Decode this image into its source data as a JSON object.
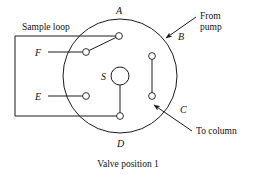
{
  "figure": {
    "caption": "Valve position 1",
    "kind": "rotary-sample-injection-valve-diagram"
  },
  "labels": {
    "sample_loop": "Sample loop",
    "from_pump_line1": "From",
    "from_pump_line2": "pump",
    "to_column": "To column"
  },
  "ports": [
    {
      "id": "A",
      "label": "A",
      "position": "top"
    },
    {
      "id": "B",
      "label": "B",
      "position": "upper-right"
    },
    {
      "id": "C",
      "label": "C",
      "position": "lower-right"
    },
    {
      "id": "D",
      "label": "D",
      "position": "bottom"
    },
    {
      "id": "E",
      "label": "E",
      "position": "lower-left"
    },
    {
      "id": "F",
      "label": "F",
      "position": "upper-left"
    }
  ],
  "rotor": {
    "id": "S",
    "label": "S"
  },
  "connections": [
    {
      "from": "A",
      "to": "F",
      "style": "diagonal"
    },
    {
      "from": "B",
      "to": "C",
      "style": "vertical"
    },
    {
      "from": "S",
      "to": "D",
      "style": "vertical"
    }
  ],
  "flows": [
    {
      "name": "from-pump",
      "target": "B"
    },
    {
      "name": "to-column",
      "source": "C"
    }
  ],
  "colors": {
    "ink": "#1b1b1b",
    "background": "#ffffff"
  }
}
